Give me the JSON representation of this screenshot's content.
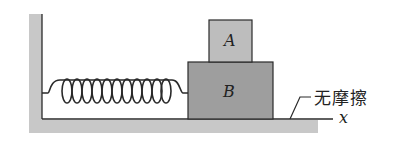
{
  "diagram": {
    "blocks": [
      {
        "label": "A",
        "color": "#bdbdbd"
      },
      {
        "label": "B",
        "color": "#9e9e9e"
      }
    ],
    "surface_label": "无摩擦",
    "axis_label": "x",
    "colors": {
      "wall": "#c8c8c8",
      "line": "#2a2a2a"
    }
  }
}
